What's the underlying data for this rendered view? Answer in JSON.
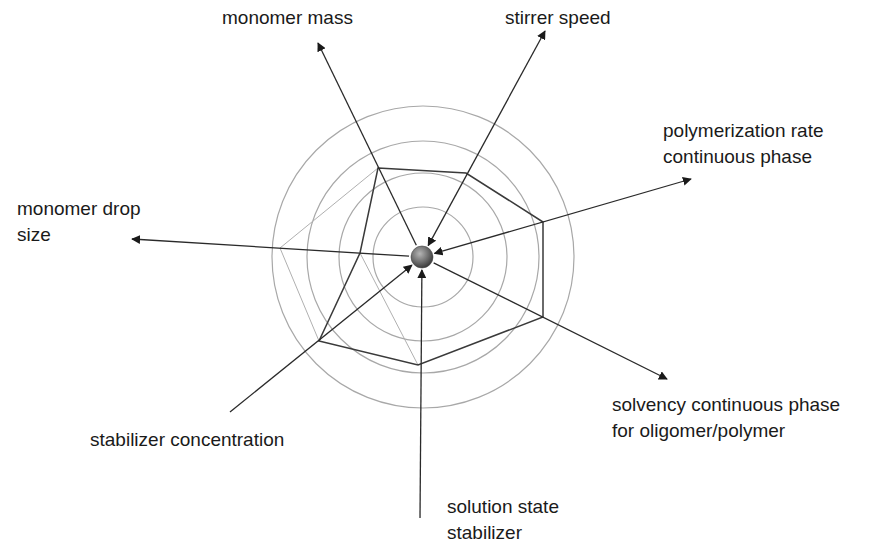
{
  "diagram": {
    "type": "radar-influence-diagram",
    "center": {
      "x": 422,
      "y": 257,
      "label": ""
    },
    "rings": {
      "radii": [
        50,
        84,
        116,
        151
      ],
      "color": "#a8a8a8"
    },
    "colors": {
      "axis": "#2a2a2a",
      "polygon_main": "#3a3a3a",
      "polygon_secondary": "#b0b0b0",
      "ball": "#7a7a7a"
    },
    "axes": [
      {
        "id": "monomer-mass",
        "lines": [
          "monomer mass"
        ],
        "tip": {
          "x": 318,
          "y": 43
        },
        "arrow_out": true,
        "arrow_in": false,
        "label_pos": {
          "x": 222,
          "y": 5
        }
      },
      {
        "id": "stirrer-speed",
        "lines": [
          "stirrer speed"
        ],
        "tip": {
          "x": 545,
          "y": 31
        },
        "arrow_out": true,
        "arrow_in": true,
        "label_pos": {
          "x": 505,
          "y": 5
        }
      },
      {
        "id": "polymerization-rate",
        "lines": [
          "polymerization rate",
          "continuous phase"
        ],
        "tip": {
          "x": 691,
          "y": 179
        },
        "arrow_out": true,
        "arrow_in": true,
        "label_pos": {
          "x": 663,
          "y": 118
        }
      },
      {
        "id": "solvency",
        "lines": [
          "solvency continuous phase",
          "for oligomer/polymer"
        ],
        "tip": {
          "x": 667,
          "y": 379
        },
        "arrow_out": true,
        "arrow_in": false,
        "label_pos": {
          "x": 612,
          "y": 392
        }
      },
      {
        "id": "solution-state-stabilizer",
        "lines": [
          "solution state",
          "stabilizer"
        ],
        "tip": {
          "x": 420,
          "y": 518
        },
        "arrow_out": false,
        "arrow_in": true,
        "label_pos": {
          "x": 447,
          "y": 494
        }
      },
      {
        "id": "stabilizer-concentration",
        "lines": [
          "stabilizer concentration"
        ],
        "tip": {
          "x": 230,
          "y": 412
        },
        "arrow_out": false,
        "arrow_in": true,
        "label_pos": {
          "x": 90,
          "y": 427
        }
      },
      {
        "id": "monomer-drop-size",
        "lines": [
          "monomer drop",
          "size"
        ],
        "tip": {
          "x": 132,
          "y": 239
        },
        "arrow_out": true,
        "arrow_in": false,
        "label_pos": {
          "x": 17,
          "y": 196
        }
      }
    ],
    "polygon_main": [
      [
        378,
        168
      ],
      [
        466,
        173
      ],
      [
        543,
        222
      ],
      [
        543,
        317
      ],
      [
        418,
        365
      ],
      [
        319,
        341
      ],
      [
        360,
        253
      ]
    ],
    "polygon_secondary": [
      [
        378,
        168
      ],
      [
        280,
        248
      ],
      [
        319,
        341
      ]
    ],
    "secondary_extra": [
      [
        360,
        253
      ],
      [
        418,
        365
      ]
    ]
  }
}
